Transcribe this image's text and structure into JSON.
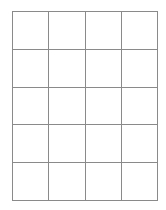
{
  "grid": {
    "columns": 4,
    "rows": 5,
    "line_color": "#8a8a8a",
    "cells": [
      [
        "",
        "",
        "",
        ""
      ],
      [
        "",
        "",
        "",
        ""
      ],
      [
        "",
        "",
        "",
        ""
      ],
      [
        "",
        "",
        "",
        ""
      ],
      [
        "",
        "",
        "",
        ""
      ]
    ]
  }
}
